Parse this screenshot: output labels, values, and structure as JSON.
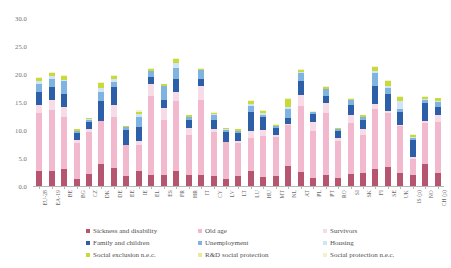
{
  "chart_data": {
    "type": "bar",
    "title": "",
    "xlabel": "",
    "ylabel": "",
    "ylim": [
      0,
      30
    ],
    "ytick_labels": [
      "30.0",
      "25.0",
      "20.0",
      "15.0",
      "10.0",
      "5.0",
      "0.0"
    ],
    "grid": false,
    "stacked": true,
    "legend_position": "bottom",
    "categories": [
      "EU-28",
      "EA-19",
      "BE",
      "BG",
      "CZ",
      "DK",
      "DE",
      "EE",
      "IE",
      "EL",
      "ES",
      "FR",
      "HR",
      "IT",
      "CY",
      "LV",
      "LT",
      "LU",
      "HU",
      "MT",
      "NL",
      "AT",
      "PL",
      "PT",
      "RO",
      "SI",
      "SK",
      "FI",
      "SE",
      "UK",
      "IS (p)",
      "NO",
      "CH (p)"
    ],
    "series": [
      {
        "name": "Sickness and disability",
        "color": "#b5556f",
        "values": [
          2.6,
          2.6,
          3.1,
          1.2,
          2.2,
          3.9,
          3.3,
          1.8,
          2.6,
          1.9,
          2.0,
          2.7,
          1.9,
          1.9,
          1.7,
          1.2,
          1.7,
          2.7,
          1.6,
          1.8,
          3.6,
          2.5,
          1.5,
          1.9,
          1.4,
          2.1,
          2.3,
          3.0,
          3.4,
          2.3,
          1.9,
          4.0,
          2.4
        ]
      },
      {
        "name": "Old age",
        "color": "#f2b8ce",
        "values": [
          10.4,
          11.0,
          9.2,
          6.4,
          7.4,
          7.8,
          9.1,
          5.6,
          4.8,
          14.1,
          9.8,
          12.4,
          7.3,
          13.4,
          8.0,
          6.6,
          6.0,
          5.8,
          7.4,
          6.9,
          7.3,
          11.7,
          8.4,
          11.2,
          6.6,
          9.2,
          6.9,
          10.8,
          9.6,
          8.5,
          2.9,
          7.3,
          9.0
        ]
      },
      {
        "name": "Survivors",
        "color": "#f7dbe6",
        "values": [
          1.5,
          1.7,
          1.9,
          0.6,
          0.5,
          0.0,
          2.0,
          0.0,
          0.7,
          2.2,
          2.2,
          1.7,
          1.1,
          2.6,
          0.5,
          0.1,
          0.3,
          1.4,
          1.0,
          0.4,
          0.2,
          2.0,
          1.5,
          1.8,
          0.6,
          1.4,
          0.9,
          0.9,
          0.4,
          0.1,
          0.3,
          0.3,
          1.2
        ]
      },
      {
        "name": "Family and children",
        "color": "#2d5fa8",
        "values": [
          2.3,
          2.3,
          2.2,
          1.3,
          1.3,
          3.4,
          3.2,
          2.6,
          2.4,
          1.2,
          1.3,
          2.4,
          1.5,
          1.3,
          1.6,
          1.7,
          1.5,
          3.4,
          2.3,
          1.2,
          1.1,
          2.6,
          1.5,
          1.2,
          1.3,
          1.8,
          1.7,
          3.1,
          3.0,
          2.4,
          3.1,
          3.2,
          1.5
        ]
      },
      {
        "name": "Unemployment",
        "color": "#7fb3e0",
        "values": [
          1.4,
          1.6,
          2.4,
          0.4,
          0.4,
          1.7,
          1.0,
          0.5,
          1.9,
          1.1,
          2.5,
          1.9,
          0.6,
          1.6,
          0.8,
          0.4,
          0.3,
          1.0,
          0.4,
          0.4,
          1.5,
          1.4,
          0.3,
          1.2,
          0.2,
          0.8,
          0.6,
          2.3,
          1.1,
          0.5,
          0.3,
          0.5,
          0.9
        ]
      },
      {
        "name": "Housing",
        "color": "#cfe4f5",
        "values": [
          0.6,
          0.5,
          0.2,
          0.0,
          0.1,
          0.7,
          0.6,
          0.0,
          0.5,
          0.1,
          0.1,
          0.8,
          0.0,
          0.0,
          0.2,
          0.1,
          0.0,
          0.3,
          0.3,
          0.0,
          0.4,
          0.1,
          0.0,
          0.0,
          0.0,
          0.0,
          0.0,
          0.4,
          0.4,
          1.4,
          0.2,
          0.2,
          0.2
        ]
      },
      {
        "name": "Social exclusion n.e.c.",
        "color": "#c9d93a"
      },
      {
        "name": "R&D social protection",
        "color": "#e8ec9a"
      },
      {
        "name": "Social protection n.e.c.",
        "color": "#f4f2c8"
      }
    ],
    "series_extra_values": {
      "Social exclusion n.e.c.": [
        0.5,
        0.5,
        0.7,
        0.2,
        0.2,
        0.9,
        0.4,
        0.2,
        0.4,
        0.3,
        0.3,
        0.8,
        0.2,
        0.1,
        0.3,
        0.2,
        0.3,
        0.6,
        0.4,
        0.2,
        1.4,
        0.4,
        0.1,
        0.4,
        0.2,
        0.3,
        0.2,
        0.7,
        0.8,
        0.7,
        0.5,
        0.4,
        0.5
      ],
      "R&D social protection": [
        0.0,
        0.0,
        0.0,
        0.0,
        0.0,
        0.0,
        0.0,
        0.0,
        0.0,
        0.0,
        0.0,
        0.0,
        0.0,
        0.0,
        0.0,
        0.0,
        0.0,
        0.0,
        0.0,
        0.0,
        0.0,
        0.0,
        0.0,
        0.0,
        0.0,
        0.0,
        0.0,
        0.0,
        0.0,
        0.0,
        0.0,
        0.0,
        0.0
      ],
      "Social protection n.e.c.": [
        0.2,
        0.2,
        0.2,
        0.1,
        0.1,
        0.2,
        0.2,
        0.1,
        0.2,
        0.1,
        0.1,
        0.2,
        0.1,
        0.1,
        0.1,
        0.1,
        0.1,
        0.2,
        0.1,
        0.1,
        0.2,
        0.2,
        0.1,
        0.1,
        0.1,
        0.1,
        0.1,
        0.2,
        0.2,
        0.2,
        0.1,
        0.1,
        0.1
      ]
    }
  },
  "legend": {
    "items": [
      {
        "label": "Sickness and disability",
        "color": "#b5556f"
      },
      {
        "label": "Old age",
        "color": "#f2b8ce"
      },
      {
        "label": "Survivors",
        "color": "#f7dbe6"
      },
      {
        "label": "Family and children",
        "color": "#2d5fa8"
      },
      {
        "label": "Unemployment",
        "color": "#7fb3e0"
      },
      {
        "label": "Housing",
        "color": "#cfe4f5"
      },
      {
        "label": "Social exclusion n.e.c.",
        "color": "#c9d93a"
      },
      {
        "label": "R&D social protection",
        "color": "#e8ec9a"
      },
      {
        "label": "Social protection n.e.c.",
        "color": "#f4f2c8"
      }
    ]
  }
}
